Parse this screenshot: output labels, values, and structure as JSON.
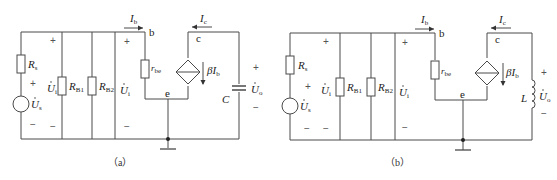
{
  "figures": [
    {
      "id": "a",
      "caption": "（a）",
      "labels": {
        "rs": "R",
        "rs_sub": "s",
        "us": "U",
        "us_sub": "s",
        "ui_left": "U",
        "ui_left_sub": "i",
        "rb1": "R",
        "rb1_sub": "B1",
        "rb2": "R",
        "rb2_sub": "B2",
        "ui_right": "U",
        "ui_right_sub": "i",
        "ib": "I",
        "ib_sub": "b",
        "ic": "I",
        "ic_sub": "c",
        "node_b": "b",
        "node_c": "c",
        "node_e": "e",
        "rbe": "r",
        "rbe_sub": "be",
        "beta_ib": "βI",
        "beta_ib_sub": "b",
        "load": "C",
        "uo": "U",
        "uo_sub": "o",
        "plus": "+",
        "minus": "−"
      },
      "load_type": "capacitor"
    },
    {
      "id": "b",
      "caption": "（b）",
      "labels": {
        "rs": "R",
        "rs_sub": "s",
        "us": "U",
        "us_sub": "s",
        "ui_left": "U",
        "ui_left_sub": "i",
        "rb1": "R",
        "rb1_sub": "B1",
        "rb2": "R",
        "rb2_sub": "B2",
        "ui_right": "U",
        "ui_right_sub": "i",
        "ib": "I",
        "ib_sub": "b",
        "ic": "I",
        "ic_sub": "c",
        "node_b": "b",
        "node_c": "c",
        "node_e": "e",
        "rbe": "r",
        "rbe_sub": "be",
        "beta_ib": "βI",
        "beta_ib_sub": "b",
        "load": "L",
        "uo": "U",
        "uo_sub": "o",
        "plus": "+",
        "minus": "−"
      },
      "load_type": "inductor"
    }
  ],
  "colors": {
    "wire": "#4a4a4a",
    "text": "#222222"
  }
}
